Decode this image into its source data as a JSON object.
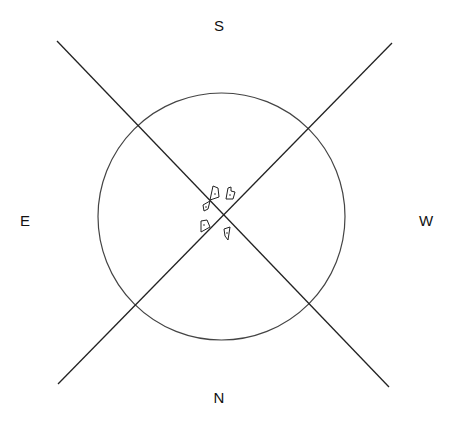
{
  "diagram": {
    "type": "compass-rose-plot",
    "labels": {
      "top": {
        "text": "S",
        "x": 219,
        "y": 25
      },
      "bottom": {
        "text": "N",
        "x": 219,
        "y": 397
      },
      "left": {
        "text": "E",
        "x": 25,
        "y": 220
      },
      "right": {
        "text": "W",
        "x": 426,
        "y": 220
      }
    },
    "circle": {
      "cx": 221.5,
      "cy": 216.5,
      "r": 123.5,
      "stroke": "#444444"
    },
    "lines": [
      {
        "name": "diagonal-nw-se",
        "x1": 57,
        "y1": 41,
        "x2": 389,
        "y2": 387,
        "stroke": "#222222"
      },
      {
        "name": "diagonal-ne-sw",
        "x1": 392,
        "y1": 43,
        "x2": 58,
        "y2": 384,
        "stroke": "#222222"
      }
    ],
    "glyphs": [
      {
        "name": "glyph-a",
        "points": "213,186 218,188 219,197 210,200",
        "dot": [
          215,
          194
        ]
      },
      {
        "name": "glyph-b",
        "points": "228,188 231,187 231,191 235,192 233,199 226,199",
        "dot": [
          230,
          195
        ]
      },
      {
        "name": "glyph-c",
        "points": "203,205 210,201 208,209 204,211",
        "dot": [
          206,
          207
        ]
      },
      {
        "name": "glyph-d",
        "points": "201,221 207,220 210,227 201,232",
        "dot": [
          204,
          225
        ]
      },
      {
        "name": "glyph-e",
        "points": "224,229 230,227 228,240 225,236",
        "dot": [
          227,
          233
        ]
      }
    ]
  }
}
